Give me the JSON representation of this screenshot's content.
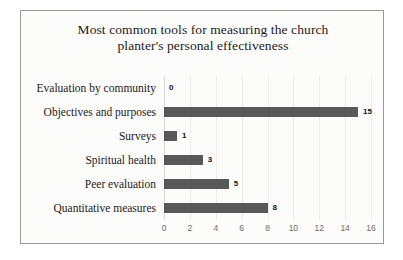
{
  "chart_data": {
    "type": "bar",
    "orientation": "horizontal",
    "title": "Most common tools for measuring  the church planter's personal effectiveness",
    "title_line1": "Most common tools for measuring  the church",
    "title_line2": "planter's personal effectiveness",
    "categories": [
      "Evaluation by community",
      "Objectives and purposes",
      "Surveys",
      "Spiritual health",
      "Peer evaluation",
      "Quantitative measures"
    ],
    "values": [
      0,
      15,
      1,
      3,
      5,
      8
    ],
    "data_labels": [
      "0",
      "15",
      "1",
      "3",
      "5",
      "8"
    ],
    "xlabel": "",
    "ylabel": "",
    "xlim": [
      0,
      16
    ],
    "xticks": [
      0,
      2,
      4,
      6,
      8,
      10,
      12,
      14,
      16
    ],
    "xtick_labels": [
      "0",
      "2",
      "4",
      "6",
      "8",
      "10",
      "12",
      "14",
      "16"
    ],
    "grid": true,
    "legend": false,
    "bar_color": "#595959",
    "plot_background": "#fcfcfb",
    "border_color": "#9a9a9a",
    "gridline_color": "#ededed"
  }
}
